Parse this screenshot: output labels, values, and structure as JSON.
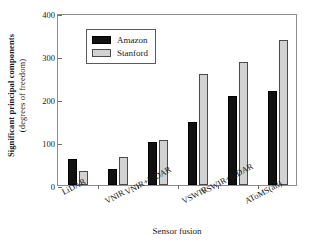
{
  "chart_data": {
    "type": "bar",
    "title": "",
    "subtitle": "",
    "xlabel": "Sensor fusion",
    "ylabel_line1": "Significant principal components",
    "ylabel_line2": "(degrees of freedom)",
    "ylabel": "Significant principal components (degrees of freedom)",
    "categories": [
      "LiDAR",
      "VNIR",
      "VNIR+LiDAR",
      "VSWIR",
      "VSWIR+LiDAR",
      "AToMS(all)"
    ],
    "series": [
      {
        "name": "Amazon",
        "color": "#111111",
        "values": [
          60,
          38,
          99,
          147,
          208,
          218
        ]
      },
      {
        "name": "Stanford",
        "color": "#d2d2d2",
        "values": [
          32,
          65,
          104,
          258,
          286,
          338
        ]
      }
    ],
    "ylim": [
      0,
      400
    ],
    "yticks": [
      0,
      100,
      200,
      300,
      400
    ],
    "ytick_labels": [
      "0",
      "100",
      "200",
      "300",
      "400"
    ],
    "grid": false,
    "legend_position": "upper-left-inside",
    "legend_entries": [
      "Amazon",
      "Stanford"
    ]
  }
}
